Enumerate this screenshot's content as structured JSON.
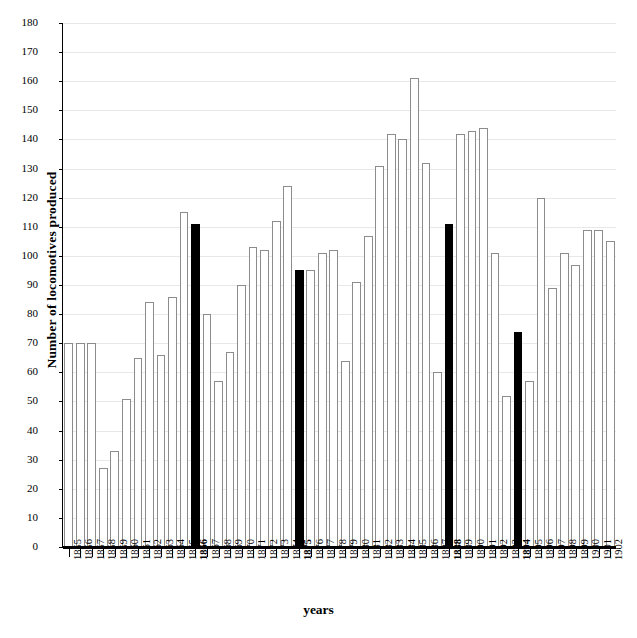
{
  "chart_data": {
    "type": "bar",
    "title": "",
    "xlabel": "years",
    "ylabel": "Number of locomotives produced",
    "ylim": [
      0,
      180
    ],
    "ytick_step": 10,
    "grid": true,
    "legend": "none",
    "bar_style": {
      "normal_fill": "#ffffff",
      "normal_border": "#8c8c8c",
      "highlight_fill": "#000000"
    },
    "highlight_categories": [
      "1866",
      "1875",
      "1888",
      "1894"
    ],
    "categories": [
      "1855",
      "1856",
      "1857",
      "1858",
      "1859",
      "1860",
      "1861",
      "1862",
      "1863",
      "1864",
      "1865",
      "1866",
      "1867",
      "1868",
      "1869",
      "1870",
      "1871",
      "1872",
      "1873",
      "1874",
      "1875",
      "1876",
      "1877",
      "1878",
      "1879",
      "1880",
      "1881",
      "1882",
      "1883",
      "1884",
      "1885",
      "1886",
      "1887",
      "1888",
      "1889",
      "1890",
      "1891",
      "1892",
      "1893",
      "1894",
      "1895",
      "1896",
      "1897",
      "1898",
      "1899",
      "1900",
      "1901",
      "1902"
    ],
    "values": [
      70,
      70,
      70,
      27,
      33,
      51,
      65,
      84,
      66,
      86,
      115,
      111,
      80,
      57,
      67,
      90,
      103,
      102,
      112,
      124,
      95,
      95,
      101,
      102,
      64,
      91,
      107,
      131,
      142,
      140,
      161,
      132,
      60,
      111,
      142,
      143,
      144,
      101,
      52,
      74,
      57,
      120,
      89,
      101,
      97,
      109,
      109,
      105
    ],
    "ytick_labels": [
      "0",
      "10",
      "20",
      "30",
      "40",
      "50",
      "60",
      "70",
      "80",
      "90",
      "100",
      "110",
      "120",
      "130",
      "140",
      "150",
      "160",
      "170",
      "180"
    ]
  }
}
